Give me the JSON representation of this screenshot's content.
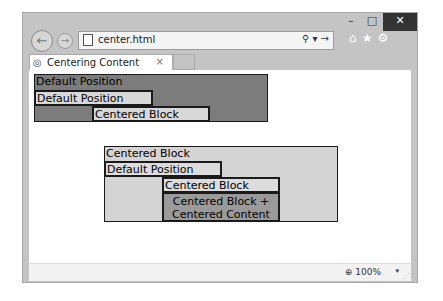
{
  "window": {
    "controls": {
      "minimize": "–",
      "maximize": "□",
      "close": "✕"
    }
  },
  "navbar": {
    "back_icon": "←",
    "forward_icon": "→",
    "url": "center.html",
    "search_icon": "⚲",
    "dropdown_icon": "▾",
    "go_icon": "→",
    "home_icon": "⌂",
    "favorites_icon": "★",
    "tools_icon": "⚙"
  },
  "tabs": [
    {
      "label": "Centering Content",
      "close_icon": "×",
      "active": true
    }
  ],
  "status": {
    "zoom_level": "100%",
    "zoom_icon": "🔍",
    "dropdown_icon": "▾",
    "grip_icon": "⋰"
  },
  "content": {
    "section1": {
      "outer_label": "Default Position",
      "default_block": "Default Position",
      "centered_block": "Centered Block"
    },
    "section2": {
      "outer_label": "Centered Block",
      "default_block": "Default Position",
      "centered_block": "Centered Block",
      "centered_content_block": "Centered Block + Centered Content"
    }
  }
}
